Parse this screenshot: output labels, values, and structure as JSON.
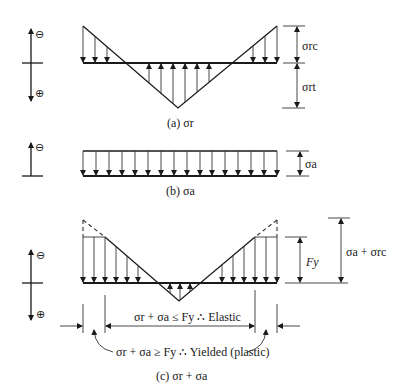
{
  "figure": {
    "panel_a": {
      "caption": "(a) σr",
      "sign_top": "⊖",
      "sign_bottom": "⊕",
      "dim_top_label": "σrc",
      "dim_bottom_label": "σrt"
    },
    "panel_b": {
      "caption": "(b) σa",
      "sign_top": "⊖",
      "dim_label": "σa"
    },
    "panel_c": {
      "caption": "(c) σr + σa",
      "sign_top": "⊖",
      "sign_bottom": "⊕",
      "dim_fy_label": "Fy",
      "dim_total_label": "σa + σrc",
      "elastic_label": "σr + σa ≤ Fy ∴ Elastic",
      "yielded_label": "σr + σa ≥ Fy ∴ Yielded (plastic)"
    }
  },
  "colors": {
    "ink": "#1a1a1a",
    "background": "#ffffff"
  }
}
